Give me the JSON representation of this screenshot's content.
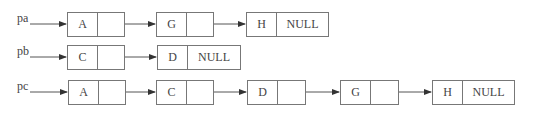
{
  "diagram": {
    "type": "linked-list-merge",
    "lists": [
      {
        "pointer": "pa",
        "nodes": [
          {
            "data": "A",
            "next": ""
          },
          {
            "data": "G",
            "next": ""
          },
          {
            "data": "H",
            "next": "NULL"
          }
        ]
      },
      {
        "pointer": "pb",
        "nodes": [
          {
            "data": "C",
            "next": ""
          },
          {
            "data": "D",
            "next": "NULL"
          }
        ]
      },
      {
        "pointer": "pc",
        "nodes": [
          {
            "data": "A",
            "next": ""
          },
          {
            "data": "C",
            "next": ""
          },
          {
            "data": "D",
            "next": ""
          },
          {
            "data": "G",
            "next": ""
          },
          {
            "data": "H",
            "next": "NULL"
          }
        ]
      }
    ],
    "colors": {
      "line": "#555555",
      "border": "#777777",
      "text": "#444444"
    }
  }
}
